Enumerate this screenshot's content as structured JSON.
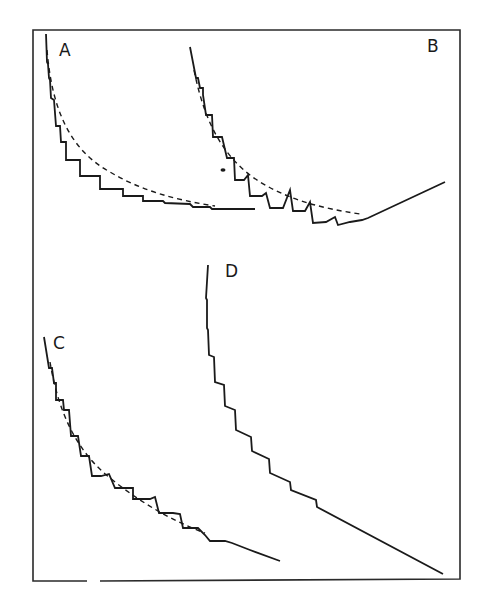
{
  "figure": {
    "colors": {
      "ink": "#1a1a1a",
      "frame": "#2a2a2a",
      "background": "#ffffff"
    },
    "panels": [
      {
        "id": "A",
        "label": "A",
        "has_dashed_fit": true,
        "tail": "flat"
      },
      {
        "id": "B",
        "label": "B",
        "has_dashed_fit": true,
        "tail": "rising-linear"
      },
      {
        "id": "C",
        "label": "C",
        "has_dashed_fit": true,
        "tail": "falling-linear"
      },
      {
        "id": "D",
        "label": "D",
        "has_dashed_fit": false,
        "tail": "falling-linear"
      }
    ]
  }
}
